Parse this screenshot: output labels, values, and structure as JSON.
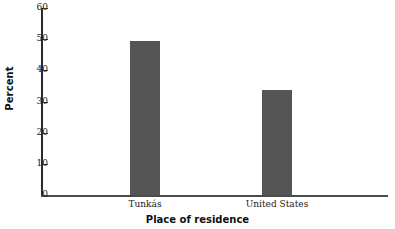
{
  "chart_data": {
    "type": "bar",
    "title": "",
    "xlabel": "Place of residence",
    "ylabel": "Percent",
    "categories": [
      "Tunkás",
      "United States"
    ],
    "values": [
      49.4,
      33.7
    ],
    "ylim": [
      0,
      60
    ],
    "yticks": [
      0,
      10,
      20,
      30,
      40,
      50,
      60
    ],
    "ytick_labels": [
      "0",
      "10",
      "20",
      "30",
      "40",
      "50",
      "60"
    ],
    "grid": false,
    "legend": null,
    "bar_color": "#555555",
    "axis_color": "#2b2b2b",
    "background": "#ffffff"
  }
}
